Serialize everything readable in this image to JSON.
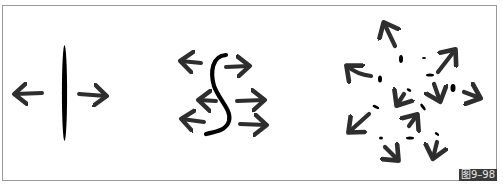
{
  "figure": {
    "caption": "图9–98",
    "colors": {
      "frame": "#9a9a9a",
      "ink": "#2e2e2e",
      "line": "#000000",
      "caption_bg": "#3a3a3a",
      "caption_fg": "#e8e8e8"
    },
    "panels": [
      {
        "id": "straight-line",
        "description": "vertical straight line with arrows pushing left and right",
        "arrows": [
          "left",
          "right"
        ]
      },
      {
        "id": "s-curve",
        "description": "S-shaped curve with arrows on both sides",
        "arrows": [
          "left",
          "right",
          "left",
          "right",
          "left",
          "right"
        ]
      },
      {
        "id": "scattered-dots",
        "description": "scattered short marks with arrows pointing outward and inward in many directions",
        "arrows": [
          "up-left",
          "left",
          "up-right",
          "right",
          "down-left",
          "down",
          "down-left",
          "up-right",
          "down-right",
          "down"
        ]
      }
    ]
  }
}
